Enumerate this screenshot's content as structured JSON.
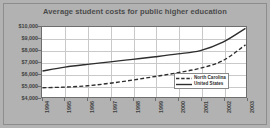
{
  "chart_data": {
    "type": "line",
    "title": "Average student costs for public higher education",
    "xlabel": "",
    "ylabel": "",
    "ylim": [
      4000,
      10000
    ],
    "ytick_labels": [
      "$10,000",
      "$9,000",
      "$8,000",
      "$7,000",
      "$6,000",
      "$5,000",
      "$4,000"
    ],
    "ytick_values": [
      10000,
      9000,
      8000,
      7000,
      6000,
      5000,
      4000
    ],
    "categories": [
      "1994",
      "1995",
      "1996",
      "1997",
      "1998",
      "1999",
      "2000",
      "2001",
      "2002",
      "2003"
    ],
    "x": [
      1994,
      1995,
      1996,
      1997,
      1998,
      1999,
      2000,
      2001,
      2002,
      2003
    ],
    "grid": true,
    "legend_position": "bottom-right",
    "series": [
      {
        "name": "North Carolina",
        "style": "dashed",
        "color": "#2e2e2e",
        "values": [
          4790,
          4850,
          4960,
          5180,
          5450,
          5760,
          6080,
          6470,
          7120,
          8470
        ]
      },
      {
        "name": "United States",
        "style": "solid",
        "color": "#2e2e2e",
        "values": [
          6230,
          6560,
          6800,
          7010,
          7230,
          7450,
          7690,
          7980,
          8700,
          9880
        ]
      }
    ]
  },
  "legend": {
    "items": [
      {
        "label": "North Carolina",
        "style": "dashed"
      },
      {
        "label": "United States",
        "style": "solid"
      }
    ]
  },
  "colors": {
    "background": "#b2b2b2",
    "plot_background": "#ffffff",
    "grid": "#c9c9c9",
    "axis": "#6e6e6e",
    "text": "#3f3f3f",
    "line": "#2e2e2e"
  }
}
